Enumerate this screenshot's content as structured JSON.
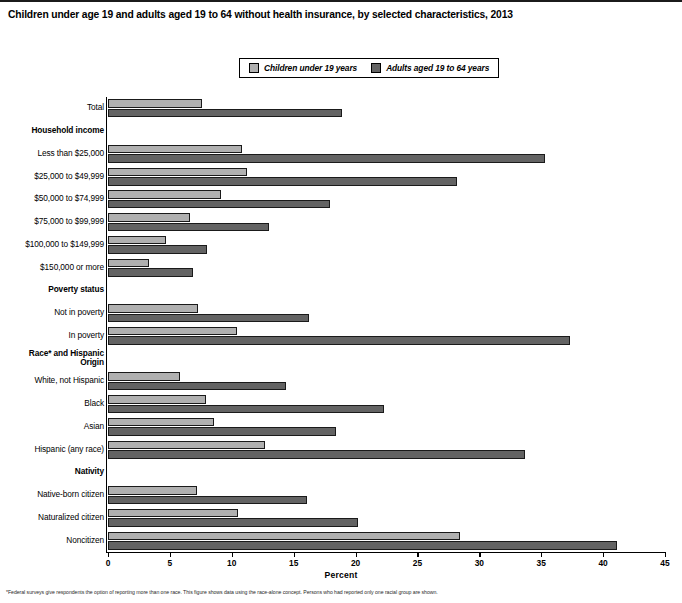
{
  "title": "Children under age 19 and adults aged 19 to 64 without health insurance, by selected characteristics, 2013",
  "legend": {
    "items": [
      {
        "label": "Children under 19 years",
        "color": "#b0b0b0",
        "icon": "legend-swatch-icon"
      },
      {
        "label": "Adults aged 19 to 64 years",
        "color": "#636363",
        "icon": "legend-swatch-icon"
      }
    ]
  },
  "axis": {
    "xlabel": "Percent",
    "ticks": [
      "0",
      "5",
      "10",
      "15",
      "20",
      "25",
      "30",
      "35",
      "40",
      "45"
    ]
  },
  "footnote": "*Federal surveys give respondents the option of reporting more than one race. This figure shows data using the race-alone concept. Persons who had reported only one racial group are shown.",
  "chart_data": {
    "type": "bar",
    "orientation": "horizontal",
    "title": "Children under age 19 and adults aged 19 to 64 without health insurance, by selected characteristics, 2013",
    "xlabel": "Percent",
    "ylabel": "",
    "xlim": [
      0,
      45
    ],
    "xticks": [
      0,
      5,
      10,
      15,
      20,
      25,
      30,
      35,
      40,
      45
    ],
    "grid": false,
    "legend_position": "top-center",
    "categories": [
      "Total",
      "Household income",
      "Less than $25,000",
      "$25,000 to $49,999",
      "$50,000 to $74,999",
      "$75,000 to $99,999",
      "$100,000 to $149,999",
      "$150,000 or more",
      "Poverty status",
      "Not in poverty",
      "In poverty",
      "Race* and Hispanic Origin",
      "White, not Hispanic",
      "Black",
      "Asian",
      "Hispanic (any race)",
      "Nativity",
      "Native-born citizen",
      "Naturalized citizen",
      "Noncitizen"
    ],
    "series": [
      {
        "name": "Children under 19 years",
        "color": "#b0b0b0",
        "values": [
          7.6,
          null,
          10.8,
          11.2,
          9.1,
          6.6,
          4.7,
          3.3,
          null,
          7.3,
          10.4,
          null,
          5.8,
          7.9,
          8.6,
          12.7,
          null,
          7.2,
          10.5,
          28.4
        ]
      },
      {
        "name": "Adults aged 19 to 64 years",
        "color": "#636363",
        "values": [
          18.9,
          null,
          35.3,
          28.2,
          17.9,
          13.0,
          8.0,
          6.9,
          null,
          16.2,
          37.3,
          null,
          14.4,
          22.3,
          18.4,
          33.7,
          null,
          16.1,
          20.2,
          41.1
        ]
      }
    ],
    "section_headers": [
      "Household income",
      "Poverty status",
      "Race* and Hispanic Origin",
      "Nativity"
    ]
  }
}
